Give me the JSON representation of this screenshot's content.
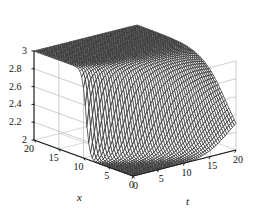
{
  "chart_data": {
    "type": "surface",
    "title": "",
    "xlabel": "x",
    "ylabel": "t",
    "zlabel": "",
    "xlim": [
      0,
      20
    ],
    "ylim": [
      0,
      20
    ],
    "zlim": [
      2,
      3
    ],
    "x_ticks": [
      20,
      15,
      10,
      5,
      0
    ],
    "x_ticklabels": [
      "20",
      "15",
      "10",
      "5",
      "0"
    ],
    "t_ticks": [
      0,
      5,
      10,
      15,
      20
    ],
    "t_ticklabels": [
      "0",
      "5",
      "10",
      "15",
      "20"
    ],
    "z_ticks": [
      3,
      2.8,
      2.6,
      2.4,
      2.2,
      2
    ],
    "z_ticklabels": [
      "3",
      "2.8",
      "2.6",
      "2.4",
      "2.2",
      "2"
    ],
    "grid": true,
    "legend": false,
    "mesh_color": "#2b2b2b",
    "grid_color": "#b9b9b9",
    "axis_color": "#1a1a1a",
    "background": "#ffffff",
    "surface": {
      "z_plateau_high": 3,
      "z_plateau_low": 2,
      "front_form": "u = 2 + 1/(1 + exp(k*(x0(t) - x)))",
      "front_center_at_t0": 9.5,
      "front_center_at_tmax": 2.0,
      "steepness_at_t0": 2.6,
      "steepness_at_tmax": 0.42
    },
    "grid_lines": {
      "z_levels": [
        2,
        2.2,
        2.4,
        2.6,
        2.8,
        3
      ],
      "x_levels": [
        0,
        5,
        10,
        15,
        20
      ],
      "t_levels": [
        0,
        5,
        10,
        15,
        20
      ]
    }
  },
  "axes": {
    "x_label": "x",
    "t_label": "t"
  }
}
